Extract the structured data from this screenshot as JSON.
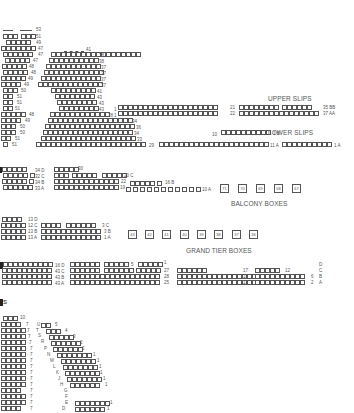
{
  "sections": {
    "upper_slips": {
      "title": "UPPER SLIPS",
      "labels": [
        "21",
        "22",
        "35 BB",
        "37 AA",
        "1",
        "1"
      ]
    },
    "lower_slips": {
      "title": "LOWER SLIPS",
      "labels": [
        "10",
        "1 B",
        "29",
        "11 A",
        "1 A"
      ]
    },
    "gallery_left": {
      "row_labels": [
        "53",
        "51",
        "49",
        "47",
        "47",
        "47",
        "48",
        "48",
        "49",
        "49",
        "50",
        "51",
        "51",
        "48",
        "49",
        "50",
        "50",
        "51",
        "51"
      ]
    },
    "gallery_center": {
      "row_labels": [
        "41",
        "38",
        "38",
        "37",
        "37",
        "37",
        "37",
        "41",
        "43",
        "43",
        "43",
        "38",
        "34",
        "36",
        "34",
        "33",
        "29"
      ]
    },
    "balcony": {
      "rows": [
        "34 D",
        "32 C",
        "34 B",
        "33 A"
      ],
      "labels": [
        "30",
        "20 C",
        "22",
        "16 B",
        "19",
        "10 A"
      ]
    },
    "balcony_boxes": {
      "title": "BALCONY BOXES",
      "boxes": [
        "71",
        "70",
        "69",
        "68",
        "67"
      ]
    },
    "grand_tier": {
      "rows": [
        "13 D",
        "12 C",
        "13 B",
        "13 A"
      ],
      "labels": [
        "3 C",
        "3 B",
        "1 A"
      ]
    },
    "grand_tier_boxes": {
      "title": "GRAND TIER BOXES",
      "boxes": [
        "43",
        "42",
        "41",
        "40",
        "39",
        "38",
        "37",
        "36"
      ]
    },
    "stalls_circle": {
      "rows": [
        "16 D",
        "43 C",
        "43 B",
        "43 A"
      ],
      "labels": [
        "5",
        "1",
        "27",
        "28",
        "25",
        "17",
        "16",
        "13",
        "12",
        "6",
        "2",
        "D",
        "C",
        "B",
        "A"
      ]
    },
    "stalls": {
      "title_fragment": "s",
      "left_labels": [
        "10",
        "7",
        "7",
        "7",
        "7",
        "7",
        "7",
        "7",
        "7",
        "7",
        "7",
        "7",
        "7",
        "7",
        "7",
        "7"
      ],
      "row_letters": [
        "U",
        "T",
        "S",
        "R",
        "P",
        "N",
        "M",
        "L",
        "K",
        "J",
        "H",
        "G",
        "F",
        "E",
        "D"
      ],
      "right_labels": [
        "5",
        "4",
        "3",
        "2",
        "2",
        "1",
        "1",
        "1",
        "1",
        "1",
        "1",
        "1",
        "1"
      ]
    }
  }
}
